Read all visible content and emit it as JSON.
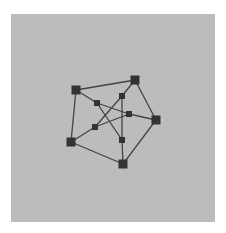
{
  "diagram": {
    "type": "graph",
    "name": "Petersen graph",
    "colors": {
      "background": "#bcbcbc",
      "node": "#333333",
      "edge": "#444444",
      "page": "#ffffff"
    },
    "nodes": [
      {
        "id": "o1",
        "x": 76,
        "y": 90,
        "size": 9,
        "ring": "outer"
      },
      {
        "id": "o2",
        "x": 135,
        "y": 80,
        "size": 9,
        "ring": "outer"
      },
      {
        "id": "o3",
        "x": 156,
        "y": 120,
        "size": 9,
        "ring": "outer"
      },
      {
        "id": "o4",
        "x": 123,
        "y": 164,
        "size": 9,
        "ring": "outer"
      },
      {
        "id": "o5",
        "x": 71,
        "y": 142,
        "size": 9,
        "ring": "outer"
      },
      {
        "id": "i1",
        "x": 97,
        "y": 103,
        "size": 6,
        "ring": "inner"
      },
      {
        "id": "i2",
        "x": 122,
        "y": 96,
        "size": 6,
        "ring": "inner"
      },
      {
        "id": "i3",
        "x": 129,
        "y": 114,
        "size": 6,
        "ring": "inner"
      },
      {
        "id": "i4",
        "x": 122,
        "y": 140,
        "size": 6,
        "ring": "inner"
      },
      {
        "id": "i5",
        "x": 95,
        "y": 127,
        "size": 6,
        "ring": "inner"
      }
    ],
    "edges": [
      [
        "o1",
        "o2"
      ],
      [
        "o2",
        "o3"
      ],
      [
        "o3",
        "o4"
      ],
      [
        "o4",
        "o5"
      ],
      [
        "o5",
        "o1"
      ],
      [
        "o1",
        "i1"
      ],
      [
        "o2",
        "i2"
      ],
      [
        "o3",
        "i3"
      ],
      [
        "o4",
        "i4"
      ],
      [
        "o5",
        "i5"
      ],
      [
        "i1",
        "i3"
      ],
      [
        "i3",
        "i5"
      ],
      [
        "i5",
        "i2"
      ],
      [
        "i2",
        "i4"
      ],
      [
        "i4",
        "i1"
      ]
    ]
  }
}
